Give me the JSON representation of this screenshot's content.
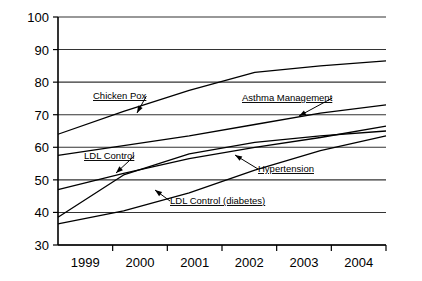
{
  "chart_data": {
    "type": "line",
    "title": "",
    "xlabel": "",
    "ylabel": "",
    "x": [
      "1999",
      "2000",
      "2001",
      "2002",
      "2003",
      "2004"
    ],
    "xlim": [
      1999,
      2004
    ],
    "ylim": [
      30,
      100
    ],
    "yticks": [
      30,
      40,
      50,
      60,
      70,
      80,
      90,
      100
    ],
    "grid": true,
    "legend_position": "inline-annotations",
    "series": [
      {
        "name": "Chicken Pox",
        "values": [
          64.0,
          71.0,
          77.5,
          83.0,
          85.0,
          86.5
        ]
      },
      {
        "name": "Asthma Management",
        "values": [
          57.5,
          60.5,
          63.5,
          67.0,
          70.5,
          73.0
        ]
      },
      {
        "name": "LDL Control",
        "values": [
          47.0,
          52.0,
          56.5,
          60.0,
          63.0,
          66.5
        ]
      },
      {
        "name": "Hypertension",
        "values": [
          38.5,
          51.5,
          58.0,
          61.5,
          63.5,
          65.0
        ]
      },
      {
        "name": "LDL Control (diabetes)",
        "values": [
          36.5,
          40.5,
          46.0,
          53.0,
          59.0,
          63.5
        ]
      }
    ],
    "annotations": [
      {
        "label": "Chicken Pox",
        "label_x": 93,
        "label_y": 99,
        "arrow_x": 137,
        "arrow_y": 113
      },
      {
        "label": "Asthma Management",
        "label_x": 242,
        "label_y": 101,
        "arrow_x": 299,
        "arrow_y": 116
      },
      {
        "label": "LDL Control",
        "label_x": 84,
        "label_y": 159,
        "arrow_x": 116,
        "arrow_y": 173
      },
      {
        "label": "Hypertension",
        "label_x": 258,
        "label_y": 172,
        "arrow_x": 235,
        "arrow_y": 155
      },
      {
        "label": "LDL Control (diabetes)",
        "label_x": 170,
        "label_y": 204,
        "arrow_x": 155,
        "arrow_y": 190
      }
    ],
    "colors": {
      "axis": "#000000",
      "grid": "#333333",
      "line": "#000000",
      "background": "#ffffff"
    }
  }
}
